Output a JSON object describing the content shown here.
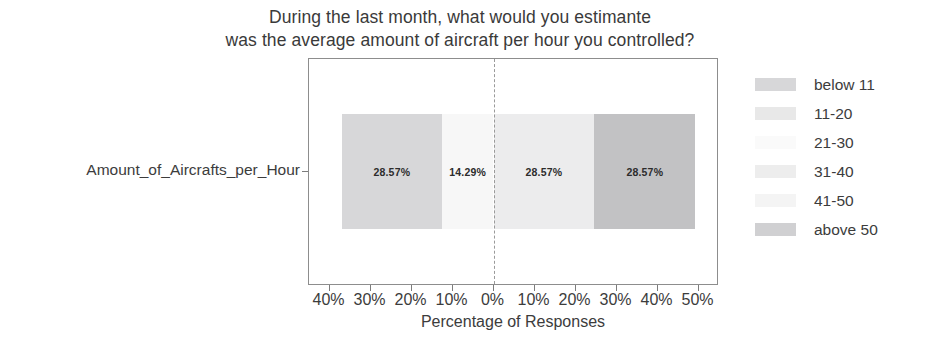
{
  "chart_data": {
    "type": "bar",
    "title": "During the last month, what would you estimante was the average amount of aircraft per hour you controlled?",
    "title_lines": [
      "During the last month, what would you estimante",
      "was the average amount of aircraft per hour you controlled?"
    ],
    "subtitle": "",
    "xlabel": "Percentage of Responses",
    "ylabel": "",
    "categories": [
      "Amount_of_Aircrafts_per_Hour"
    ],
    "orientation": "horizontal",
    "stacked": "diverging",
    "grid": false,
    "legend_position": "right",
    "xlim": [
      -45,
      55
    ],
    "xticks": [
      -40,
      -30,
      -20,
      -10,
      0,
      10,
      20,
      30,
      40,
      50
    ],
    "xtick_labels": [
      "40%",
      "30%",
      "20%",
      "10%",
      "0%",
      "10%",
      "20%",
      "30%",
      "40%",
      "50%"
    ],
    "zero_reference_line": 0,
    "series": [
      {
        "name": "below 11",
        "values": [
          28.57
        ],
        "label": "28.57%",
        "color": "#d7d7d9",
        "start_percent": -37.0,
        "end_percent": -12.6
      },
      {
        "name": "11-20",
        "values": [
          14.29
        ],
        "label": "14.29%",
        "color": "#f7f7f7",
        "start_percent": -12.6,
        "end_percent": 0.0
      },
      {
        "name": "21-30",
        "values": [
          0
        ],
        "label": "",
        "color": "#fdfdfd",
        "start_percent": 0.0,
        "end_percent": 0.0
      },
      {
        "name": "31-40",
        "values": [
          28.57
        ],
        "label": "28.57%",
        "color": "#ececed",
        "start_percent": 0.0,
        "end_percent": 24.6
      },
      {
        "name": "41-50",
        "values": [
          0
        ],
        "label": "",
        "color": "#f2f2f2",
        "start_percent": 24.6,
        "end_percent": 24.6
      },
      {
        "name": "above 50",
        "values": [
          28.57
        ],
        "label": "28.57%",
        "color": "#c2c2c4",
        "start_percent": 24.6,
        "end_percent": 49.2
      }
    ],
    "bar_labels": [
      "28.57%",
      "14.29%",
      "28.57%",
      "28.57%"
    ]
  },
  "legend": {
    "items": [
      {
        "label": "below 11",
        "color": "#d7d7d9"
      },
      {
        "label": "11-20",
        "color": "#e8e8e8"
      },
      {
        "label": "21-30",
        "color": "#fafafa"
      },
      {
        "label": "31-40",
        "color": "#ededed"
      },
      {
        "label": "41-50",
        "color": "#f4f4f4"
      },
      {
        "label": "above 50",
        "color": "#d0d0d2"
      }
    ]
  },
  "axes": {
    "y_category_label": "Amount_of_Aircrafts_per_Hour",
    "x_axis_title": "Percentage of Responses",
    "x_tick_labels": [
      "40%",
      "30%",
      "20%",
      "10%",
      "0%",
      "10%",
      "20%",
      "30%",
      "40%",
      "50%"
    ]
  },
  "colors": {
    "axis": "#8d8d8d",
    "text": "#3c3c3c",
    "zero_line": "#9a9a9a",
    "background": "#ffffff"
  }
}
